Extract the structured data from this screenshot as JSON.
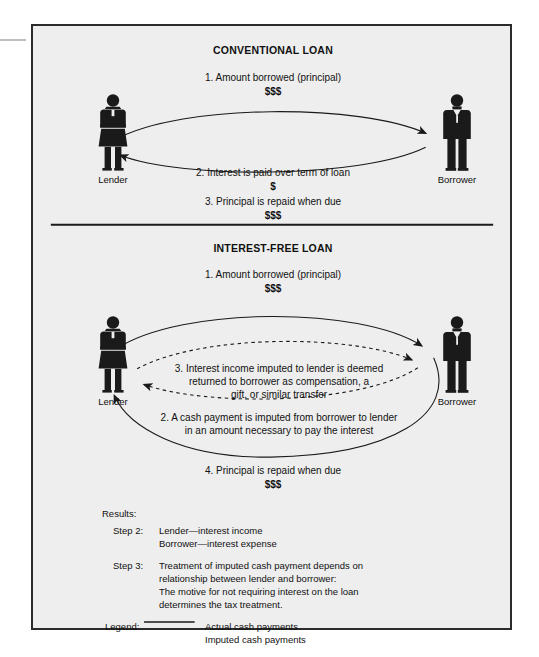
{
  "document": {
    "title": "Conventional Loan vs. Interest-Free Loan",
    "background_color": "#eeeeee",
    "border_color": "#2b2b2b",
    "ink_color": "#111111"
  },
  "sections": [
    {
      "id": "conventional",
      "title": "CONVENTIONAL LOAN",
      "left_actor": "Lender",
      "right_actor": "Borrower",
      "above_text_line1": "1. Amount borrowed (principal)",
      "above_text_line2": "$$$",
      "below_text_line1": "2. Interest is paid over term of loan",
      "below_text_line2": "$",
      "below_text_line3": "3. Principal is repaid when due",
      "below_text_line4": "$$$"
    },
    {
      "id": "interest-free",
      "title": "INTEREST-FREE LOAN",
      "left_actor": "Lender",
      "right_actor": "Borrower",
      "above_text_line1": "1. Amount borrowed (principal)",
      "above_text_line2": "$$$",
      "inner_text_line1": "3. Interest income imputed to lender is deemed",
      "inner_text_line2": "returned to borrower as compensation, a",
      "inner_text_line3": "gift, or similar transfer",
      "outer_text_line1": "2. A cash payment is imputed from borrower to lender",
      "outer_text_line2": "in an amount necessary to pay the interest",
      "below_text_line1": "4. Principal is repaid when due",
      "below_text_line2": "$$$"
    }
  ],
  "results": {
    "heading": "Results:",
    "rows": [
      {
        "label": "Step 2:",
        "lines": [
          "Lender—interest income",
          "Borrower—interest expense"
        ]
      },
      {
        "label": "Step 3:",
        "lines": [
          "Treatment of imputed cash payment depends on",
          "relationship between lender and borrower:",
          "The motive for not requiring interest on the loan",
          "determines the tax treatment."
        ]
      }
    ]
  },
  "legend": {
    "heading": "Legend:",
    "entries": [
      {
        "style": "solid",
        "label": "Actual cash payments"
      },
      {
        "style": "dashed",
        "label": "Imputed cash payments"
      }
    ]
  }
}
